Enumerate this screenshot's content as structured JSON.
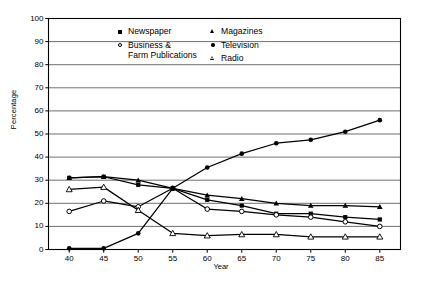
{
  "chart_data": {
    "type": "line",
    "title": "",
    "xlabel": "Year",
    "ylabel": "Percentage",
    "x": [
      40,
      45,
      50,
      55,
      60,
      65,
      70,
      75,
      80,
      85
    ],
    "xtick_labels": [
      "40",
      "45",
      "50",
      "55",
      "60",
      "65",
      "70",
      "75",
      "80",
      "85"
    ],
    "ytick_labels": [
      "0",
      "10",
      "20",
      "30",
      "40",
      "50",
      "60",
      "70",
      "80",
      "90",
      "100"
    ],
    "xlim": [
      37,
      88
    ],
    "ylim": [
      0,
      100
    ],
    "grid": "horizontal",
    "legend_position": "top-center-inside",
    "series": [
      {
        "name": "Newspaper",
        "marker": "filled-square",
        "values": [
          31,
          31.5,
          28,
          26.5,
          21.5,
          19,
          15.5,
          15.5,
          14,
          13
        ]
      },
      {
        "name": "Business & Farm Publications",
        "marker": "open-circle",
        "values": [
          16.5,
          21,
          18.5,
          26.5,
          17.5,
          16.5,
          15,
          14,
          12,
          10
        ]
      },
      {
        "name": "Magazines",
        "marker": "filled-triangle",
        "values": [
          31,
          31.5,
          30,
          26.5,
          23.5,
          22,
          20,
          19,
          19,
          18.5
        ]
      },
      {
        "name": "Television",
        "marker": "filled-circle",
        "values": [
          0.5,
          0.5,
          7,
          26.5,
          35.5,
          41.5,
          46,
          47.5,
          51,
          56
        ]
      },
      {
        "name": "Radio",
        "marker": "open-triangle",
        "values": [
          26,
          27,
          17,
          7,
          6,
          6.5,
          6.5,
          5.5,
          5.5,
          5.5
        ]
      }
    ]
  },
  "legend": {
    "col1": [
      {
        "label": "Newspaper",
        "line2": "",
        "marker": "filled-square"
      },
      {
        "label": "Business &",
        "line2": "Farm Publications",
        "marker": "open-circle"
      }
    ],
    "col2": [
      {
        "label": "Magazines",
        "line2": "",
        "marker": "filled-triangle"
      },
      {
        "label": "Television",
        "line2": "",
        "marker": "filled-circle"
      },
      {
        "label": "Radio",
        "line2": "",
        "marker": "open-triangle"
      }
    ]
  },
  "axis": {
    "y_title": "Percentage",
    "x_title": "Year"
  },
  "colors": {
    "line": "#000000",
    "grid": "#555555",
    "frame": "#000000",
    "background": "#ffffff"
  }
}
